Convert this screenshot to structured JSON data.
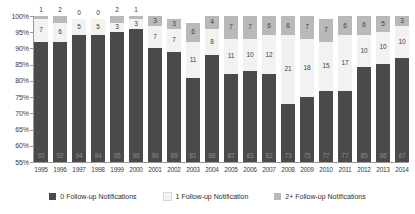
{
  "chart_data": {
    "type": "bar",
    "stacked": true,
    "title": "",
    "subtitle": "",
    "xlabel": "",
    "ylabel": "",
    "ylim": [
      55,
      100
    ],
    "yticks": [
      "100%",
      "95%",
      "90%",
      "85%",
      "80%",
      "75%",
      "70%",
      "65%",
      "60%",
      "55%"
    ],
    "grid": false,
    "legend_position": "bottom",
    "categories": [
      "1995",
      "1996",
      "1997",
      "1998",
      "1999",
      "2000",
      "2001",
      "2002",
      "2003",
      "2004",
      "2005",
      "2006",
      "2007",
      "2008",
      "2009",
      "2010",
      "2011",
      "2012",
      "2013",
      "2014"
    ],
    "series": [
      {
        "name": "0 Follow-up Notifications",
        "color": "#4a4a4a",
        "values": [
          92,
          92,
          94,
          94,
          95,
          96,
          90,
          89,
          81,
          88,
          82,
          83,
          82,
          73,
          75,
          77,
          77,
          85,
          86,
          87
        ]
      },
      {
        "name": "1 Follow-up Notification",
        "color": "#f2f2f2",
        "values": [
          7,
          6,
          5,
          5,
          3,
          3,
          7,
          7,
          11,
          8,
          11,
          10,
          12,
          21,
          18,
          15,
          17,
          10,
          10,
          10
        ]
      },
      {
        "name": "2+ Follow-up Notifications",
        "color": "#b9b9b9",
        "values": [
          1,
          2,
          0,
          0,
          2,
          1,
          3,
          3,
          6,
          4,
          7,
          7,
          6,
          6,
          7,
          7,
          6,
          6,
          5,
          3
        ]
      }
    ]
  },
  "legend": {
    "items": [
      {
        "label": "0 Follow-up Notifications",
        "color": "#4a4a4a"
      },
      {
        "label": "1 Follow-up Notification",
        "color": "#f2f2f2"
      },
      {
        "label": "2+ Follow-up Notifications",
        "color": "#b9b9b9"
      }
    ]
  }
}
